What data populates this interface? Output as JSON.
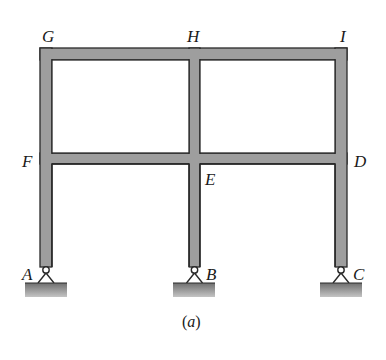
{
  "figure": {
    "caption_open": "(",
    "caption_letter": "a",
    "caption_close": ")",
    "member_fill": "#9e9e9e",
    "member_stroke": "#2a2a2a",
    "ground_fill_top": "#7a7a7a",
    "ground_fill_bottom": "#b8b8b8"
  },
  "joints": {
    "G": "G",
    "H": "H",
    "I": "I",
    "F": "F",
    "E": "E",
    "D": "D",
    "A": "A",
    "B": "B",
    "C": "C"
  },
  "supports": [
    {
      "label": "A",
      "type": "pin"
    },
    {
      "label": "B",
      "type": "pin"
    },
    {
      "label": "C",
      "type": "pin"
    }
  ]
}
